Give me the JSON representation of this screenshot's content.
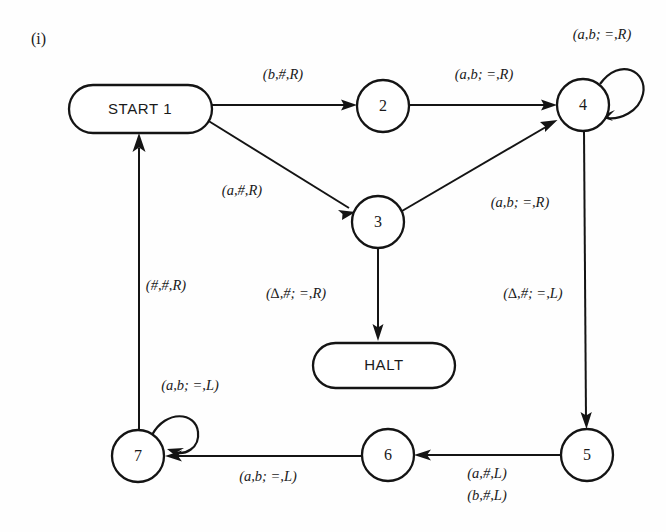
{
  "figure": {
    "caption": "(i)",
    "ink_color": "#141414",
    "background_color": "#fefefe"
  },
  "nodes": [
    {
      "id": "start",
      "label": "START  1",
      "shape": "stadium",
      "cx": 140,
      "cy": 109
    },
    {
      "id": "n2",
      "label": "2",
      "shape": "circle",
      "cx": 383,
      "cy": 106
    },
    {
      "id": "n3",
      "label": "3",
      "shape": "circle",
      "cx": 378,
      "cy": 222
    },
    {
      "id": "n4",
      "label": "4",
      "shape": "circle",
      "cx": 583,
      "cy": 105
    },
    {
      "id": "n5",
      "label": "5",
      "shape": "circle",
      "cx": 587,
      "cy": 455
    },
    {
      "id": "n6",
      "label": "6",
      "shape": "circle",
      "cx": 388,
      "cy": 455
    },
    {
      "id": "n7",
      "label": "7",
      "shape": "circle",
      "cx": 138,
      "cy": 456
    },
    {
      "id": "halt",
      "label": "HALT",
      "shape": "stadium",
      "cx": 384,
      "cy": 366
    }
  ],
  "edges": [
    {
      "id": "start-to-2",
      "from": "start",
      "to": "n2",
      "label": "(b,#,R)",
      "label_x": 283,
      "label_y": 76
    },
    {
      "id": "start-to-3",
      "from": "start",
      "to": "n3",
      "label": "(a,#,R)",
      "label_x": 242,
      "label_y": 192
    },
    {
      "id": "2-to-4",
      "from": "n2",
      "to": "n4",
      "label": "(a,b; =,R)",
      "label_x": 484,
      "label_y": 76
    },
    {
      "id": "3-to-4",
      "from": "n3",
      "to": "n4",
      "label": "(a,b; =,R)",
      "label_x": 520,
      "label_y": 204
    },
    {
      "id": "4-self",
      "from": "n4",
      "to": "n4",
      "label": "(a,b; =,R)",
      "label_x": 602,
      "label_y": 36
    },
    {
      "id": "3-to-halt",
      "from": "n3",
      "to": "halt",
      "label": "(∆,#; =,R)",
      "label_x": 296,
      "label_y": 295
    },
    {
      "id": "4-to-5",
      "from": "n4",
      "to": "n5",
      "label": "(∆,#; =,L)",
      "label_x": 533,
      "label_y": 295
    },
    {
      "id": "5-to-6",
      "from": "n5",
      "to": "n6",
      "label": "(a,#,L)",
      "label_x": 487,
      "label_y": 475
    },
    {
      "id": "5-to-6-alt",
      "from": "n5",
      "to": "n6",
      "label": "(b,#,L)",
      "label_x": 487,
      "label_y": 497
    },
    {
      "id": "6-to-7",
      "from": "n6",
      "to": "n7",
      "label": "(a,b; =,L)",
      "label_x": 268,
      "label_y": 478
    },
    {
      "id": "7-self",
      "from": "n7",
      "to": "n7",
      "label": "(a,b; =,L)",
      "label_x": 190,
      "label_y": 387
    },
    {
      "id": "7-to-start",
      "from": "n7",
      "to": "start",
      "label": "(#,#,R)",
      "label_x": 166,
      "label_y": 287
    }
  ]
}
